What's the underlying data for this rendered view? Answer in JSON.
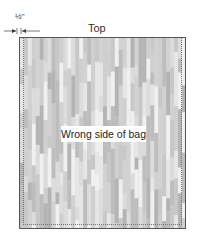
{
  "diagram": {
    "measurement": {
      "label": "½\"",
      "description": "seam allowance"
    },
    "edge_label": "Top",
    "panel_label": "Wrong side of bag",
    "colors": {
      "border": "#555555",
      "seam": "#777777",
      "stripe_tones": [
        "#bdbdbd",
        "#c8c8c8",
        "#d2d2d2",
        "#dcdcdc",
        "#e6e6e6",
        "#f0f0f0",
        "#b4b4b4",
        "#cfcfcf"
      ]
    }
  }
}
